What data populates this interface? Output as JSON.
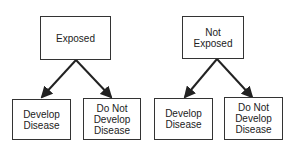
{
  "diagram": {
    "left_tree": {
      "root": {
        "label": "Exposed"
      },
      "children": [
        {
          "label": "Develop\nDisease"
        },
        {
          "label": "Do Not\nDevelop\nDisease"
        }
      ]
    },
    "right_tree": {
      "root": {
        "label": "Not\nExposed"
      },
      "children": [
        {
          "label": "Develop\nDisease"
        },
        {
          "label": "Do Not\nDevelop\nDisease"
        }
      ]
    },
    "colors": {
      "line": "#222222",
      "box_border": "#333333",
      "background": "#ffffff"
    }
  }
}
